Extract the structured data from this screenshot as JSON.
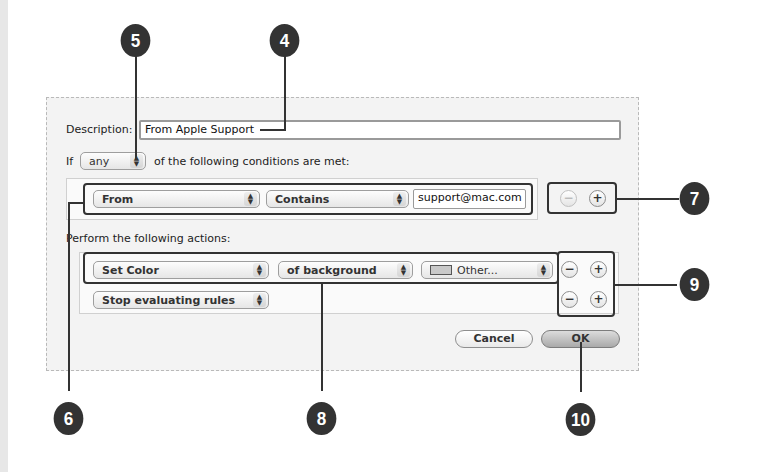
{
  "dialog": {
    "description_label": "Description:",
    "description_value": "From Apple Support",
    "if_label": "If",
    "match_selector": "any",
    "conditions_suffix": "of the following conditions are met:",
    "conditions": [
      {
        "field": "From",
        "operator": "Contains",
        "value": "support@mac.com"
      }
    ],
    "condition_buttons": {
      "remove": "−",
      "add": "+"
    },
    "actions_label": "Perform the following actions:",
    "actions": [
      {
        "action": "Set Color",
        "target": "of background",
        "color_option": "Other...",
        "swatch_color": "#c9c9c9"
      },
      {
        "action": "Stop evaluating rules"
      }
    ],
    "action_buttons": {
      "remove": "−",
      "add": "+"
    },
    "cancel_label": "Cancel",
    "ok_label": "OK"
  },
  "callouts": {
    "c4": "4",
    "c5": "5",
    "c6": "6",
    "c7": "7",
    "c8": "8",
    "c9": "9",
    "c10": "10"
  },
  "colors": {
    "callout": "#333333",
    "dialog_bg": "#f3f3f3",
    "highlight_border": "#333333"
  }
}
